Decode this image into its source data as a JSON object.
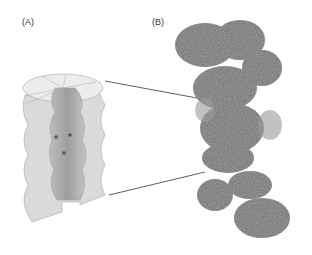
{
  "panels": [
    {
      "label": "(A)",
      "description": "cutaway schematic of nuclear pore channel"
    },
    {
      "label": "(B)",
      "description": "electron density map of protein complex"
    }
  ],
  "colors": {
    "schematic_outer": "#d9d9d9",
    "schematic_top": "#ececec",
    "schematic_channel": "#a8a8a8",
    "density_map": "#7a7a7a",
    "connector_line": "#333333"
  }
}
